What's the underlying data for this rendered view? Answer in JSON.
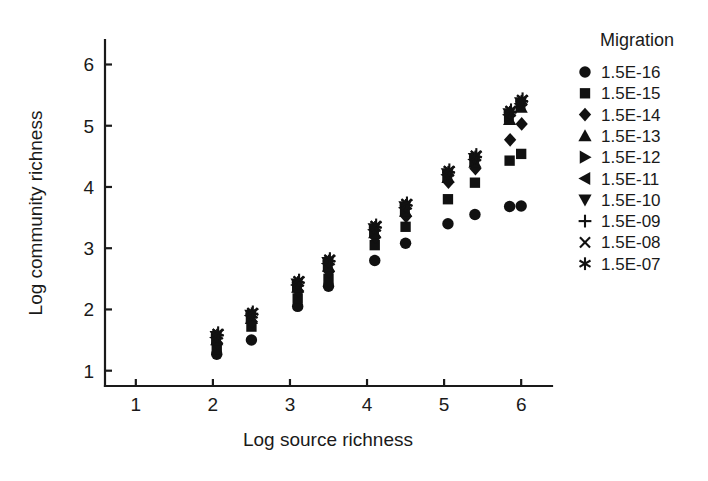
{
  "chart_data": {
    "type": "scatter",
    "title": "",
    "xlabel": "Log source richness",
    "ylabel": "Log community richness",
    "xlim": [
      0.6,
      6.4
    ],
    "ylim": [
      0.75,
      6.4
    ],
    "xticks": [
      1,
      2,
      3,
      4,
      5,
      6
    ],
    "yticks": [
      1,
      2,
      3,
      4,
      5,
      6
    ],
    "xtick_labels": [
      "1",
      "2",
      "3",
      "4",
      "5",
      "6"
    ],
    "ytick_labels": [
      "1",
      "2",
      "3",
      "4",
      "5",
      "6"
    ],
    "grid": false,
    "legend_position": "right",
    "legend_title": "Migration",
    "x": [
      2.05,
      2.5,
      3.1,
      3.5,
      4.1,
      4.5,
      5.05,
      5.4,
      5.85,
      6.0
    ],
    "series": [
      {
        "name": "1.5E-16",
        "marker": "circle",
        "values": [
          1.27,
          1.5,
          2.05,
          2.38,
          2.8,
          3.08,
          3.4,
          3.55,
          3.68,
          3.69
        ]
      },
      {
        "name": "1.5E-15",
        "marker": "square",
        "values": [
          1.35,
          1.72,
          2.18,
          2.5,
          3.05,
          3.35,
          3.8,
          4.07,
          4.43,
          4.54
        ]
      },
      {
        "name": "1.5E-14",
        "marker": "diamond",
        "values": [
          1.45,
          1.8,
          2.3,
          2.62,
          3.18,
          3.52,
          4.08,
          4.3,
          4.77,
          5.03
        ]
      },
      {
        "name": "1.5E-13",
        "marker": "triangle-up",
        "values": [
          1.5,
          1.85,
          2.36,
          2.7,
          3.25,
          3.6,
          4.15,
          4.4,
          5.1,
          5.3
        ]
      },
      {
        "name": "1.5E-12",
        "marker": "triangle-right",
        "values": [
          1.52,
          1.88,
          2.38,
          2.73,
          3.28,
          3.64,
          4.18,
          4.43,
          5.15,
          5.33
        ]
      },
      {
        "name": "1.5E-11",
        "marker": "triangle-left",
        "values": [
          1.54,
          1.9,
          2.4,
          2.75,
          3.3,
          3.66,
          4.2,
          4.45,
          5.18,
          5.36
        ]
      },
      {
        "name": "1.5E-10",
        "marker": "triangle-down",
        "values": [
          1.56,
          1.91,
          2.42,
          2.77,
          3.32,
          3.68,
          4.22,
          4.47,
          5.2,
          5.38
        ]
      },
      {
        "name": "1.5E-09",
        "marker": "plus",
        "values": [
          1.58,
          1.93,
          2.44,
          2.79,
          3.34,
          3.7,
          4.24,
          4.49,
          5.22,
          5.4
        ]
      },
      {
        "name": "1.5E-08",
        "marker": "cross",
        "values": [
          1.6,
          1.94,
          2.46,
          2.81,
          3.36,
          3.72,
          4.26,
          4.51,
          5.24,
          5.42
        ]
      },
      {
        "name": "1.5E-07",
        "marker": "asterisk",
        "values": [
          1.62,
          1.96,
          2.48,
          2.83,
          3.38,
          3.74,
          4.28,
          4.53,
          5.26,
          5.44
        ]
      }
    ]
  },
  "legend": {
    "title": "Migration",
    "entries": [
      {
        "marker": "circle",
        "label": "1.5E-16"
      },
      {
        "marker": "square",
        "label": "1.5E-15"
      },
      {
        "marker": "diamond",
        "label": "1.5E-14"
      },
      {
        "marker": "triangle-up",
        "label": "1.5E-13"
      },
      {
        "marker": "triangle-right",
        "label": "1.5E-12"
      },
      {
        "marker": "triangle-left",
        "label": "1.5E-11"
      },
      {
        "marker": "triangle-down",
        "label": "1.5E-10"
      },
      {
        "marker": "plus",
        "label": "1.5E-09"
      },
      {
        "marker": "cross",
        "label": "1.5E-08"
      },
      {
        "marker": "asterisk",
        "label": "1.5E-07"
      }
    ]
  },
  "colors": {
    "marker": "#111111",
    "axis": "#1a1a1a",
    "background": "#ffffff"
  }
}
